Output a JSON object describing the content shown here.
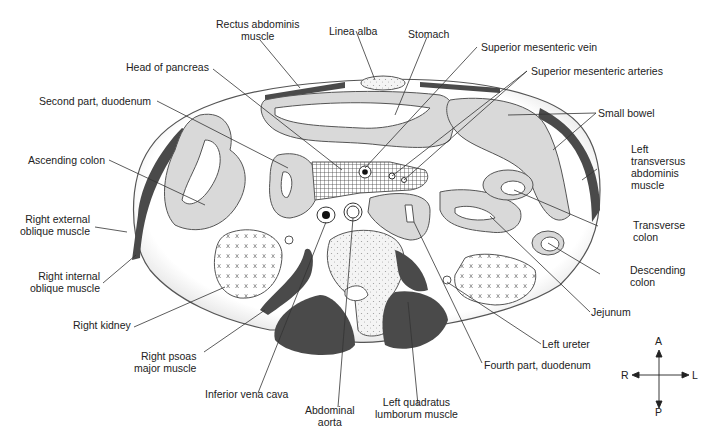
{
  "figure": {
    "colors": {
      "outline": "#555555",
      "muscle_dark": "#4a4a4a",
      "bowel_fill": "#d9d9d9",
      "background": "#ffffff",
      "label_text": "#222222"
    }
  },
  "labels": {
    "rectus_abdominis": "Rectus abdominis\nmuscle",
    "linea_alba": "Linea alba",
    "stomach": "Stomach",
    "superior_mesenteric_vein": "Superior mesenteric vein",
    "superior_mesenteric_arteries": "Superior mesenteric arteries",
    "head_of_pancreas": "Head of pancreas",
    "second_part_duodenum": "Second part, duodenum",
    "small_bowel": "Small bowel",
    "ascending_colon": "Ascending colon",
    "left_transversus_abdominis": "Left\ntransversus\nabdominis\nmuscle",
    "right_external_oblique": "Right external\noblique muscle",
    "transverse_colon": "Transverse\ncolon",
    "right_internal_oblique": "Right internal\noblique muscle",
    "descending_colon": "Descending\ncolon",
    "right_kidney": "Right kidney",
    "jejunum": "Jejunum",
    "left_ureter": "Left ureter",
    "right_psoas_major": "Right psoas\nmajor muscle",
    "fourth_part_duodenum": "Fourth part, duodenum",
    "inferior_vena_cava": "Inferior vena cava",
    "abdominal_aorta": "Abdominal\naorta",
    "left_quadratus_lumborum": "Left quadratus\nlumborum muscle"
  },
  "compass": {
    "anterior": "A",
    "posterior": "P",
    "right": "R",
    "left": "L"
  }
}
